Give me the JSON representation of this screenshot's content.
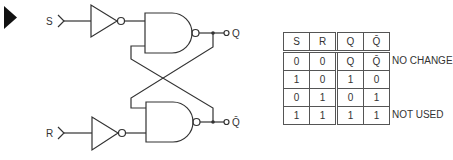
{
  "diagram": {
    "inputs": [
      {
        "label": "S"
      },
      {
        "label": "R"
      }
    ],
    "outputs": [
      {
        "label": "Q"
      },
      {
        "label": "Q̄"
      }
    ],
    "marker": "play-triangle",
    "colors": {
      "line": "#333333",
      "marker": "#111111"
    }
  },
  "truth_table": {
    "headers": [
      "S",
      "R",
      "Q",
      "Q̄"
    ],
    "rows": [
      {
        "cells": [
          "0",
          "0",
          "Q",
          "Q̄"
        ],
        "note": "NO CHANGE"
      },
      {
        "cells": [
          "1",
          "0",
          "1",
          "0"
        ],
        "note": ""
      },
      {
        "cells": [
          "0",
          "1",
          "0",
          "1"
        ],
        "note": ""
      },
      {
        "cells": [
          "1",
          "1",
          "1",
          "1"
        ],
        "note": "NOT USED"
      }
    ]
  }
}
